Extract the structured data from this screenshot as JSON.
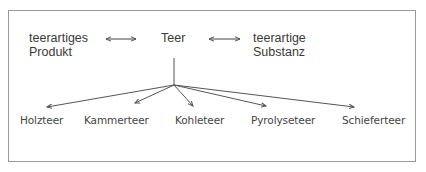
{
  "diagram": {
    "top_row": {
      "left_term": {
        "line1": "teerartiges",
        "line2": "Produkt"
      },
      "center_term": "Teer",
      "right_term": {
        "line1": "teerartige",
        "line2": "Substanz"
      },
      "relation": "double-arrow"
    },
    "branches": [
      {
        "label": "Holzteer"
      },
      {
        "label": "Kammerteer"
      },
      {
        "label": "Kohleteer"
      },
      {
        "label": "Pyrolyseteer"
      },
      {
        "label": "Schieferteer"
      }
    ],
    "colors": {
      "line": "#555555",
      "text": "#3a3a3a",
      "border": "#9a9a9a"
    }
  }
}
